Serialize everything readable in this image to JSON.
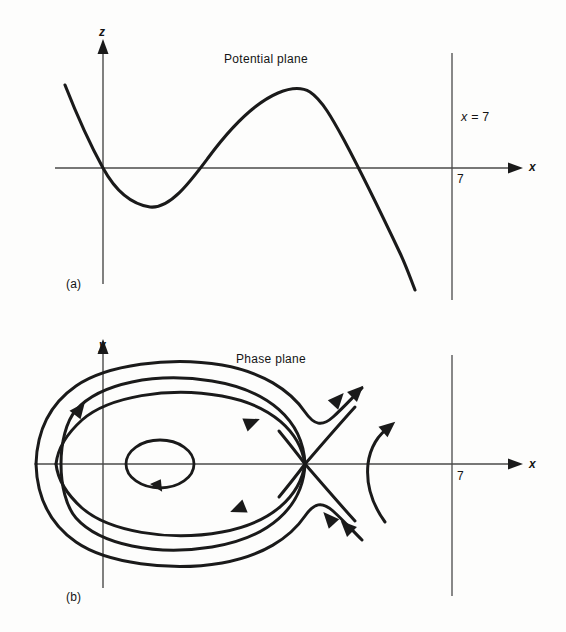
{
  "figure": {
    "panels": [
      {
        "id": "a",
        "caption": "(a)",
        "title": "Potential plane",
        "x_axis_label": "x",
        "y_axis_label": "z",
        "vertical_line_label": "x = 7",
        "vertical_line_label_var": "x",
        "vertical_line_label_rest": " = 7",
        "tick_label": "7"
      },
      {
        "id": "b",
        "caption": "(b)",
        "title": "Phase plane",
        "x_axis_label": "x",
        "y_axis_label": "y",
        "tick_label": "7"
      }
    ]
  },
  "chart_data": [
    {
      "type": "line",
      "title": "Potential plane",
      "xlabel": "x",
      "ylabel": "z",
      "grid": false,
      "legend": "none",
      "annotations": [
        "x = 7",
        "7",
        "(a)"
      ],
      "axis_origin_px": [
        103,
        168
      ],
      "xlim_px": [
        55,
        520
      ],
      "ylim_px": [
        40,
        305
      ],
      "vertical_line_x_px": 452,
      "description": "Cubic-like potential curve z(x) starting high at upper left, descending through the origin, reaching a local minimum, rising to a local maximum, then descending steeply past a zero crossing to the lower right.",
      "curve_points_px": [
        [
          65,
          85
        ],
        [
          80,
          118
        ],
        [
          92,
          145
        ],
        [
          103,
          168
        ],
        [
          115,
          188
        ],
        [
          128,
          200
        ],
        [
          140,
          206
        ],
        [
          150,
          207
        ],
        [
          162,
          202
        ],
        [
          175,
          192
        ],
        [
          190,
          178
        ],
        [
          203,
          163
        ],
        [
          218,
          147
        ],
        [
          232,
          131
        ],
        [
          248,
          116
        ],
        [
          262,
          104
        ],
        [
          278,
          95
        ],
        [
          292,
          89
        ],
        [
          302,
          88
        ],
        [
          312,
          91
        ],
        [
          322,
          99
        ],
        [
          332,
          112
        ],
        [
          342,
          130
        ],
        [
          352,
          150
        ],
        [
          362,
          170
        ],
        [
          372,
          191
        ],
        [
          384,
          216
        ],
        [
          396,
          243
        ],
        [
          406,
          267
        ],
        [
          415,
          290
        ]
      ],
      "features": {
        "zero_crossings_x_px": [
          103,
          218,
          370
        ],
        "local_minimum_px": [
          150,
          207
        ],
        "local_maximum_px": [
          302,
          88
        ]
      }
    },
    {
      "type": "line",
      "title": "Phase plane",
      "xlabel": "x",
      "ylabel": "y",
      "grid": false,
      "legend": "none",
      "annotations": [
        "7",
        "(b)"
      ],
      "axis_origin_px": [
        103,
        464
      ],
      "xlim_px": [
        35,
        520
      ],
      "ylim_px": [
        330,
        600
      ],
      "vertical_line_x_px": 452,
      "description": "Phase portrait of the potential in (a): a center near x=1.8 surrounded by closed periodic orbits, a homoclinic separatrix loop terminating at a saddle point, outer non-closed trajectories, and an open trajectory to the right of the saddle.",
      "trajectories": [
        {
          "name": "inner-closed-orbit",
          "kind": "closed",
          "center_px": [
            160,
            464
          ],
          "rx": 34,
          "ry": 24,
          "direction": "clockwise"
        },
        {
          "name": "middle-closed-orbit",
          "kind": "closed",
          "center_px": [
            176,
            464
          ],
          "rx": 116,
          "ry": 78,
          "direction": "clockwise"
        },
        {
          "name": "outer-orbit",
          "kind": "closed",
          "center_px": [
            172,
            464
          ],
          "rx": 136,
          "ry": 98,
          "direction": "clockwise"
        },
        {
          "name": "homoclinic-separatrix",
          "kind": "loop-to-saddle",
          "saddle_px": [
            305,
            464
          ]
        },
        {
          "name": "unstable-manifold-upper",
          "kind": "open",
          "direction": "outward-up-right"
        },
        {
          "name": "unstable-manifold-lower",
          "kind": "open",
          "direction": "inward-up-left"
        },
        {
          "name": "right-open-trajectory",
          "kind": "open",
          "crossing_px": [
            368,
            464
          ],
          "direction": "up-right"
        }
      ],
      "saddle_point_px": [
        305,
        464
      ],
      "center_point_px": [
        160,
        464
      ]
    }
  ]
}
